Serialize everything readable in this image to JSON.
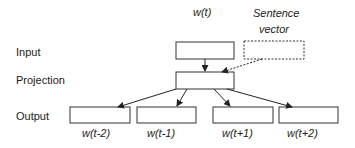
{
  "diagram": {
    "row_labels": {
      "input": "Input",
      "projection": "Projection",
      "output": "Output"
    },
    "input_word": "w(t)",
    "sentence_vector": {
      "line1": "Sentence",
      "line2": "vector"
    },
    "outputs": [
      "w(t-2)",
      "w(t-1)",
      "w(t+1)",
      "w(t+2)"
    ],
    "colors": {
      "stroke": "#333333",
      "text": "#222222",
      "background": "#ffffff"
    }
  }
}
